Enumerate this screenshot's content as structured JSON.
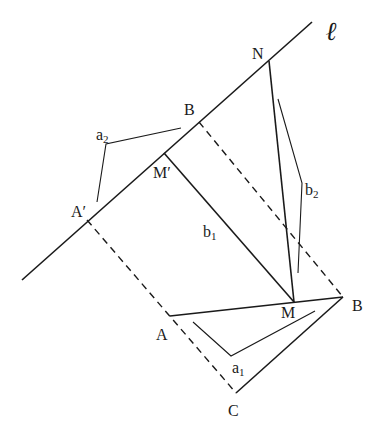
{
  "diagram": {
    "line_label": "ℓ",
    "points": {
      "N": "N",
      "B_top": "B",
      "M_prime": "M′",
      "A_prime": "A′",
      "M": "M",
      "B": "B",
      "A": "A",
      "C": "C"
    },
    "segment_labels": {
      "a1": {
        "base": "a",
        "sub": "1"
      },
      "a2": {
        "base": "a",
        "sub": "2"
      },
      "b1": {
        "base": "b",
        "sub": "1"
      },
      "b2": {
        "base": "b",
        "sub": "2"
      }
    }
  }
}
